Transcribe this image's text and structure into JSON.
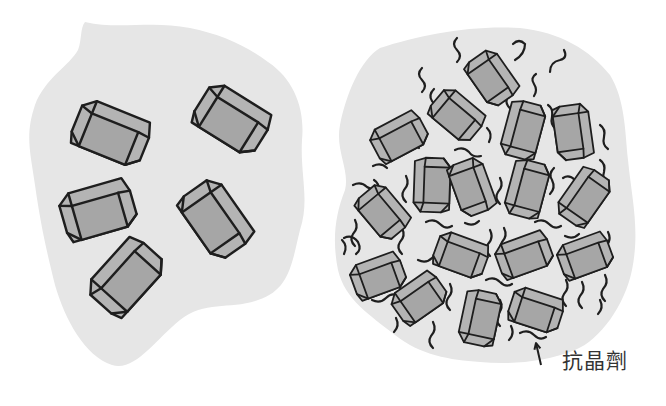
{
  "diagram": {
    "colors": {
      "background": "#ffffff",
      "blob_fill": "#e6e6e6",
      "crystal_front": "#a6a6a6",
      "crystal_side": "#b4b4b4",
      "stroke": "#1e1e1e",
      "label_text": "#333333"
    },
    "left_panel": {
      "description": "Crystals without anti-crystallization agent",
      "blob_path": "M 85 22 C 120 30 150 20 190 28 C 220 34 245 45 268 62 C 295 80 305 110 302 140 C 300 175 310 200 300 230 C 292 262 290 290 258 300 C 230 310 205 300 180 320 C 155 340 135 372 112 365 C 85 356 65 320 55 285 C 45 245 40 220 35 185 C 30 150 25 135 35 105 C 45 78 70 65 78 50 C 82 40 80 28 85 22 Z",
      "crystals": [
        {
          "cx": 111,
          "cy": 133,
          "len": 74,
          "w": 34,
          "d": 12,
          "angle": 22
        },
        {
          "cx": 232,
          "cy": 119,
          "len": 72,
          "w": 34,
          "d": 12,
          "angle": 32
        },
        {
          "cx": 98,
          "cy": 210,
          "len": 72,
          "w": 34,
          "d": 12,
          "angle": -16
        },
        {
          "cx": 216,
          "cy": 219,
          "len": 74,
          "w": 34,
          "d": 12,
          "angle": 55
        },
        {
          "cx": 126,
          "cy": 277,
          "len": 74,
          "w": 34,
          "d": 12,
          "angle": -48
        }
      ]
    },
    "right_panel": {
      "description": "Crystals with anti-crystallization agent",
      "blob_path": "M 380 48 C 420 35 470 25 520 28 C 560 32 590 50 610 75 C 625 100 625 130 628 160 C 632 200 640 230 632 270 C 625 305 600 340 575 350 C 545 362 510 365 480 362 C 450 360 420 355 395 335 C 370 315 345 300 338 270 C 332 240 335 215 345 190 C 350 170 335 150 340 125 C 346 95 360 60 380 48 Z",
      "crystals": [
        {
          "cx": 492,
          "cy": 78,
          "len": 52,
          "w": 25,
          "d": 9,
          "angle": 55
        },
        {
          "cx": 457,
          "cy": 115,
          "len": 52,
          "w": 25,
          "d": 9,
          "angle": 40
        },
        {
          "cx": 399,
          "cy": 137,
          "len": 54,
          "w": 25,
          "d": 9,
          "angle": -28
        },
        {
          "cx": 523,
          "cy": 130,
          "len": 56,
          "w": 25,
          "d": 9,
          "angle": -75
        },
        {
          "cx": 573,
          "cy": 132,
          "len": 54,
          "w": 25,
          "d": 9,
          "angle": 82
        },
        {
          "cx": 432,
          "cy": 185,
          "len": 54,
          "w": 25,
          "d": 9,
          "angle": -88
        },
        {
          "cx": 472,
          "cy": 187,
          "len": 54,
          "w": 25,
          "d": 9,
          "angle": 70
        },
        {
          "cx": 527,
          "cy": 189,
          "len": 56,
          "w": 25,
          "d": 9,
          "angle": -75
        },
        {
          "cx": 584,
          "cy": 197,
          "len": 56,
          "w": 25,
          "d": 9,
          "angle": -55
        },
        {
          "cx": 383,
          "cy": 212,
          "len": 52,
          "w": 25,
          "d": 9,
          "angle": 50
        },
        {
          "cx": 461,
          "cy": 255,
          "len": 52,
          "w": 25,
          "d": 9,
          "angle": 20
        },
        {
          "cx": 524,
          "cy": 255,
          "len": 54,
          "w": 25,
          "d": 9,
          "angle": -20
        },
        {
          "cx": 585,
          "cy": 256,
          "len": 52,
          "w": 25,
          "d": 9,
          "angle": -20
        },
        {
          "cx": 378,
          "cy": 276,
          "len": 52,
          "w": 25,
          "d": 9,
          "angle": -20
        },
        {
          "cx": 419,
          "cy": 298,
          "len": 52,
          "w": 25,
          "d": 9,
          "angle": -35
        },
        {
          "cx": 480,
          "cy": 318,
          "len": 54,
          "w": 25,
          "d": 9,
          "angle": -78
        },
        {
          "cx": 536,
          "cy": 310,
          "len": 52,
          "w": 25,
          "d": 9,
          "angle": 18
        }
      ],
      "squiggles": [
        "M 457 62 q 6 -6 0 -12 q -6 -6 0 -12",
        "M 422 92 q 6 -6 0 -12 q -6 -6 0 -12",
        "M 513 44 q 6 -6 12 0 q 0 10 -10 16",
        "M 550 72 q 0 -10 10 -12 q 8 -2 4 -10",
        "M 434 115 q 4 -8 -2 -14 q -4 -6 2 -12",
        "M 419 122 q 4 8 -2 14 q -4 6 2 12",
        "M 455 150 q 8 -4 14 2 q 4 6 12 4",
        "M 489 142 q 4 -8 -2 -14",
        "M 510 120 q 4 -8 -2 -14 q -4 -6 2 -12",
        "M 534 96 q 4 -6 0 -12 q -4 -6 2 -10",
        "M 548 105 q 6 4 4 12 q -2 8 4 12",
        "M 600 125 q 6 4 4 12 q -2 8 4 12",
        "M 600 160 q 6 4 4 12 q -2 6 2 10",
        "M 373 166 q 8 -4 14 2",
        "M 374 180 q 6 4 4 10 q -2 8 4 12",
        "M 406 176 q 4 8 -2 14 q -4 6 2 12",
        "M 353 185 q 8 -4 14 2 q 6 4 12 0",
        "M 500 178 q 4 8 -2 14 q -4 6 2 12",
        "M 554 168 q -6 6 -2 12 q 4 8 -2 14",
        "M 563 178 q 6 -4 12 2",
        "M 344 238 q 8 -4 14 4 q 4 8 -2 12",
        "M 355 220 q 4 8 -2 14 q -4 6 2 12",
        "M 402 228 q 4 8 -2 14 q -4 6 2 12",
        "M 426 222 q 8 -4 14 2 q 6 6 12 2",
        "M 465 223 q 8 4 14 -2",
        "M 490 230 q 4 8 -2 14 q -4 6 2 12",
        "M 504 228 q 4 8 -2 14 q -4 6 2 12",
        "M 535 222 q 8 -4 14 2 q 6 6 12 2",
        "M 608 232 q 4 8 -2 14 q -4 6 2 12",
        "M 565 236 q 8 4 14 -2",
        "M 342 240 q 6 6 2 14",
        "M 400 262 q 4 8 -2 14 q -4 6 2 12",
        "M 418 260 q 8 4 14 -2 q 6 -6 12 -2",
        "M 486 280 q 8 -4 14 2 q 6 6 12 2",
        "M 450 284 q 4 8 -2 14 q -4 6 2 12",
        "M 566 280 q 4 8 -2 14 q -4 6 2 12",
        "M 582 282 q 4 8 -2 14 q -4 6 2 12",
        "M 605 275 q 4 8 -2 14 q -4 6 2 12",
        "M 372 300 q 8 4 14 -2 q 6 -6 12 -2",
        "M 396 318 q 4 8 -2 14",
        "M 433 322 q 4 8 -2 14 q -4 6 2 12",
        "M 500 300 q 4 8 -2 14 q -4 6 2 12",
        "M 511 326 q 4 8 -2 14",
        "M 520 333 q 8 -4 14 2 q 6 6 12 2",
        "M 600 300 q 4 8 -2 14"
      ],
      "annotation": {
        "label": "抗晶劑",
        "arrow": {
          "x1": 541,
          "y1": 365,
          "x2": 536,
          "y2": 343
        }
      }
    }
  }
}
